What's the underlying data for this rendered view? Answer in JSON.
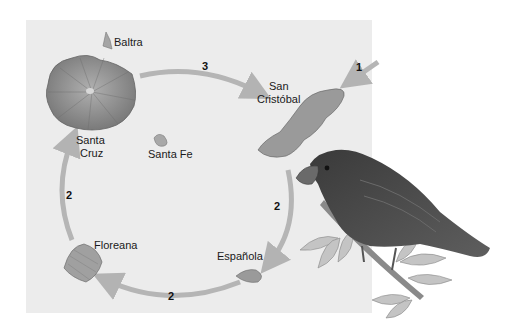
{
  "figure": {
    "type": "island-colonization-diagram",
    "islands": [
      {
        "id": "baltra",
        "label": "Baltra"
      },
      {
        "id": "santa-cruz",
        "label_line1": "Santa",
        "label_line2": "Cruz"
      },
      {
        "id": "santa-fe",
        "label": "Santa Fe"
      },
      {
        "id": "san-cristobal",
        "label_line1": "San",
        "label_line2": "Cristóbal"
      },
      {
        "id": "espanola",
        "label": "Española"
      },
      {
        "id": "floreana",
        "label": "Floreana"
      }
    ],
    "arrows": [
      {
        "from": "mainland",
        "to": "san-cristobal",
        "step": "1"
      },
      {
        "from": "san-cristobal",
        "to": "espanola",
        "step": "2"
      },
      {
        "from": "espanola",
        "to": "floreana",
        "step": "2"
      },
      {
        "from": "floreana",
        "to": "santa-cruz",
        "step": "2"
      },
      {
        "from": "santa-cruz",
        "to": "san-cristobal",
        "step": "3"
      }
    ],
    "colors": {
      "panel": "#ececec",
      "arrow": "#b5b5b5",
      "island": "#8c8c8c",
      "bird": "#4a4a4a"
    }
  }
}
